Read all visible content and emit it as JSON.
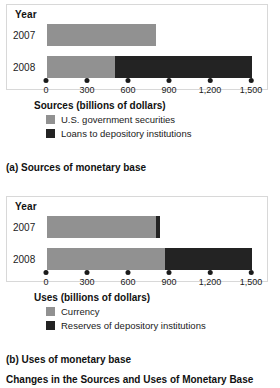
{
  "figure": {
    "title": "Changes in the Sources and Uses of Monetary Base"
  },
  "panel_a": {
    "year_header": "Year",
    "row_labels": [
      "2007",
      "2008"
    ],
    "axis_title": "Sources (billions of dollars)",
    "caption": "(a) Sources of monetary base",
    "legend": [
      {
        "label": "U.S. government securities",
        "color": "#919191"
      },
      {
        "label": "Loans to depository institutions",
        "color": "#232323"
      }
    ],
    "ticks": [
      "0",
      "300",
      "600",
      "900",
      "1,200",
      "1,500"
    ]
  },
  "panel_b": {
    "year_header": "Year",
    "row_labels": [
      "2007",
      "2008"
    ],
    "axis_title": "Uses (billions of dollars)",
    "caption": "(b) Uses of monetary base",
    "legend": [
      {
        "label": "Currency",
        "color": "#919191"
      },
      {
        "label": "Reserves of depository institutions",
        "color": "#232323"
      }
    ],
    "ticks": [
      "0",
      "300",
      "600",
      "900",
      "1,200",
      "1,500"
    ]
  },
  "chart_data": [
    {
      "type": "bar",
      "orientation": "horizontal",
      "stacked": true,
      "title": "(a) Sources of monetary base",
      "xlabel": "Sources (billions of dollars)",
      "ylabel": "Year",
      "categories": [
        "2007",
        "2008"
      ],
      "xlim": [
        0,
        1500
      ],
      "xticks": [
        0,
        300,
        600,
        900,
        1200,
        1500
      ],
      "grid": false,
      "legend_position": "below",
      "series": [
        {
          "name": "U.S. government securities",
          "color": "#919191",
          "values": [
            800,
            500
          ]
        },
        {
          "name": "Loans to depository institutions",
          "color": "#232323",
          "values": [
            0,
            1000
          ]
        }
      ],
      "totals": [
        800,
        1500
      ]
    },
    {
      "type": "bar",
      "orientation": "horizontal",
      "stacked": true,
      "title": "(b) Uses of monetary base",
      "xlabel": "Uses (billions of dollars)",
      "ylabel": "Year",
      "categories": [
        "2007",
        "2008"
      ],
      "xlim": [
        0,
        1500
      ],
      "xticks": [
        0,
        300,
        600,
        900,
        1200,
        1500
      ],
      "grid": false,
      "legend_position": "below",
      "series": [
        {
          "name": "Currency",
          "color": "#919191",
          "values": [
            800,
            860
          ]
        },
        {
          "name": "Reserves of depository institutions",
          "color": "#232323",
          "values": [
            30,
            640
          ]
        }
      ],
      "totals": [
        830,
        1500
      ]
    }
  ]
}
